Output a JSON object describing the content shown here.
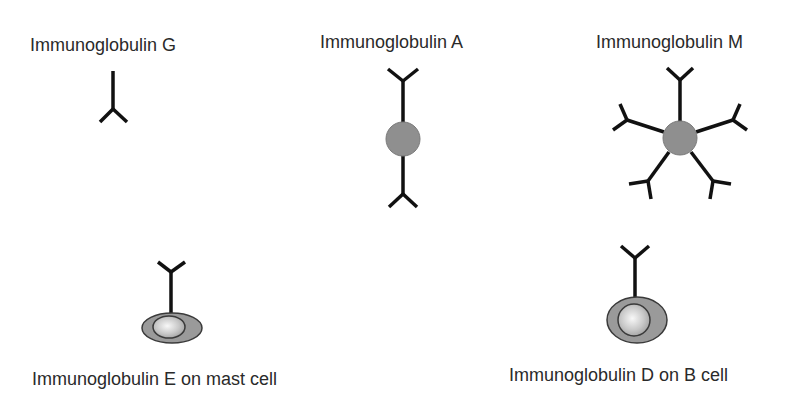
{
  "colors": {
    "stroke": "#111111",
    "core_fill": "#8f8f8f",
    "core_stroke": "#6e6e6e",
    "cell_fill": "#9a9a9a",
    "cell_stroke": "#3a3a3a",
    "nucleus_light": "#f4f4f4",
    "nucleus_dark": "#a8a8a8"
  },
  "panels": [
    {
      "id": "igg",
      "label": "Immunoglobulin G",
      "form": "monomer"
    },
    {
      "id": "iga",
      "label": "Immunoglobulin A",
      "form": "dimer"
    },
    {
      "id": "igm",
      "label": "Immunoglobulin M",
      "form": "pentamer"
    },
    {
      "id": "ige",
      "label": "Immunoglobulin E on mast cell",
      "form": "membrane-bound on mast cell"
    },
    {
      "id": "igd",
      "label": "Immunoglobulin D on B cell",
      "form": "membrane-bound on B cell"
    }
  ]
}
